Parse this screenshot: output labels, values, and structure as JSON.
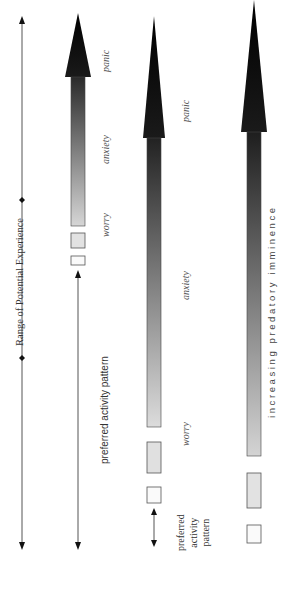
{
  "range_axis": {
    "label": "Range of Potential Experience"
  },
  "columns": [
    {
      "id": "column-1",
      "labels": {
        "panic": "panic",
        "anxiety": "anxiety",
        "worry": "worry"
      },
      "preferred_label": "preferred activity pattern"
    },
    {
      "id": "column-2",
      "labels": {
        "panic": "panic",
        "anxiety": "anxiety",
        "worry": "worry"
      },
      "preferred_label_lines": [
        "preferred",
        "activity",
        "pattern"
      ]
    },
    {
      "id": "column-3",
      "axis_label": "increasing predatory imminence"
    }
  ],
  "colors": {
    "arrow_dark": "#111111",
    "arrow_light": "#d8d8d8",
    "box_fill_light": "#e4e4e4",
    "line": "#555555"
  }
}
